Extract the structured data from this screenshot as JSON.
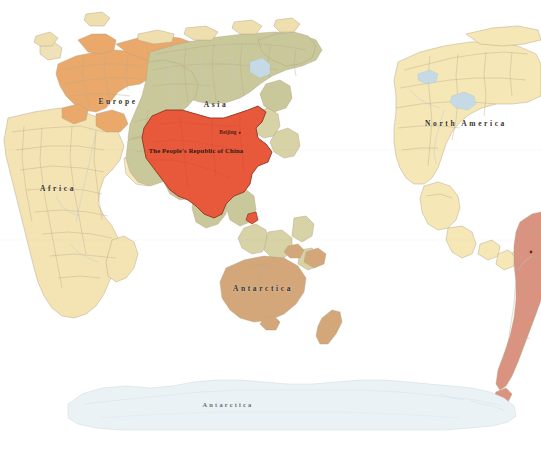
{
  "map": {
    "title": "World Map",
    "projection": "equirectangular-pacific-centered",
    "width": 541,
    "height": 461,
    "ocean_color": "#ffffff",
    "border_color": "#b09a7e",
    "coast_color": "#9a8468",
    "highlight_country": {
      "name": "The People's Republic of China",
      "label": "The People's Republic of China",
      "fill": "#e8583a",
      "stroke": "#8d3420",
      "capital": {
        "name": "Beijing",
        "label": "Beijing",
        "x": 228,
        "y": 133
      },
      "label_x": 196,
      "label_y": 150
    },
    "continents": [
      {
        "name": "europe",
        "label": "Europe",
        "x": 118,
        "y": 101,
        "fill": "#e9a96b"
      },
      {
        "name": "asia",
        "label": "Asia",
        "x": 216,
        "y": 104,
        "fill": "#c8c79a"
      },
      {
        "name": "africa",
        "label": "Africa",
        "x": 58,
        "y": 188,
        "fill": "#f3e2b0"
      },
      {
        "name": "north-america",
        "label": "North America",
        "x": 466,
        "y": 123,
        "fill": "#f5e6b4"
      },
      {
        "name": "south-america",
        "label": "South America",
        "x": 527,
        "y": 300,
        "fill": "#d9907c"
      },
      {
        "name": "oceania",
        "label": "Oceania",
        "x": 263,
        "y": 288,
        "fill": "#d3a679"
      },
      {
        "name": "antarctica",
        "label": "Antarctica",
        "x": 228,
        "y": 404,
        "fill": "#eaf2f4"
      }
    ],
    "water_features": [
      {
        "name": "caspian-sea",
        "fill": "#c5d9e4"
      },
      {
        "name": "great-lakes",
        "fill": "#c5d9e4"
      },
      {
        "name": "lake-baikal",
        "fill": "#c5d9e4"
      }
    ]
  }
}
